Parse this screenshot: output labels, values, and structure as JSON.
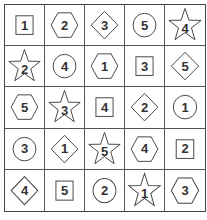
{
  "puzzle": {
    "rows": 5,
    "cols": 5,
    "cells": [
      [
        {
          "shape": "square",
          "value": "1"
        },
        {
          "shape": "hexagon",
          "value": "2"
        },
        {
          "shape": "diamond",
          "value": "3"
        },
        {
          "shape": "circle",
          "value": "5"
        },
        {
          "shape": "star",
          "value": "4"
        }
      ],
      [
        {
          "shape": "star",
          "value": "2"
        },
        {
          "shape": "circle",
          "value": "4"
        },
        {
          "shape": "hexagon",
          "value": "1"
        },
        {
          "shape": "square",
          "value": "3"
        },
        {
          "shape": "diamond",
          "value": "5"
        }
      ],
      [
        {
          "shape": "hexagon",
          "value": "5"
        },
        {
          "shape": "star",
          "value": "3"
        },
        {
          "shape": "square",
          "value": "4"
        },
        {
          "shape": "diamond",
          "value": "2"
        },
        {
          "shape": "circle",
          "value": "1"
        }
      ],
      [
        {
          "shape": "circle",
          "value": "3"
        },
        {
          "shape": "diamond",
          "value": "1"
        },
        {
          "shape": "star",
          "value": "5"
        },
        {
          "shape": "hexagon",
          "value": "4"
        },
        {
          "shape": "square",
          "value": "2"
        }
      ],
      [
        {
          "shape": "diamond",
          "value": "4"
        },
        {
          "shape": "square",
          "value": "5"
        },
        {
          "shape": "circle",
          "value": "2"
        },
        {
          "shape": "star",
          "value": "1"
        },
        {
          "shape": "hexagon",
          "value": "3"
        }
      ]
    ]
  },
  "colors": {
    "grid_line": "#555555",
    "shape_stroke": "#444444",
    "text": "#333333",
    "background": "#ffffff"
  }
}
